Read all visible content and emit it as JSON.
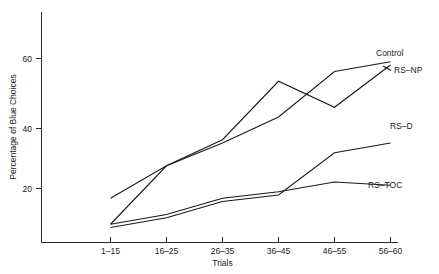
{
  "chart_data": {
    "type": "line",
    "title": "",
    "xlabel": "Trials",
    "ylabel": "Percentage of Blue Choices",
    "categories": [
      "1–15",
      "16–25",
      "26–35",
      "36–45",
      "46–55",
      "56–60"
    ],
    "yticks": [
      20,
      40,
      60
    ],
    "ylim": [
      0,
      72
    ],
    "grid": false,
    "legend_position": "right-inline-end-labels",
    "series": [
      {
        "name": "Control",
        "label": "Control",
        "values": [
          9,
          27,
          35,
          53,
          45,
          58
        ]
      },
      {
        "name": "RS-NP",
        "label": "RS–NP",
        "values": [
          17,
          27,
          34,
          42,
          56,
          59
        ]
      },
      {
        "name": "RS-D",
        "label": "RS–D",
        "values": [
          8,
          11,
          16,
          18,
          31,
          34
        ]
      },
      {
        "name": "RS-TOC",
        "label": "RS–TOC",
        "values": [
          9,
          12,
          17,
          19,
          22,
          21
        ]
      }
    ],
    "annotations": [
      {
        "text": "Control",
        "attached_series": "Control"
      },
      {
        "text": "RS–NP",
        "attached_series": "RS-NP"
      },
      {
        "text": "RS–D",
        "attached_series": "RS-D"
      },
      {
        "text": "RS–TOC",
        "attached_series": "RS-TOC"
      }
    ],
    "colors": {
      "line": "#1a1a1a",
      "axis": "#2a2a2a",
      "background": "#ffffff"
    }
  },
  "axes": {
    "y_title": "Percentage of Blue Choices",
    "x_title": "Trials",
    "y_tick_labels": [
      "20",
      "40",
      "60"
    ],
    "x_tick_labels": [
      "1–15",
      "16–25",
      "26–35",
      "36–45",
      "46–55",
      "56–60"
    ]
  },
  "series_labels": {
    "control": "Control",
    "rs_np": "RS–NP",
    "rs_d": "RS–D",
    "rs_toc": "RS–TOC"
  }
}
